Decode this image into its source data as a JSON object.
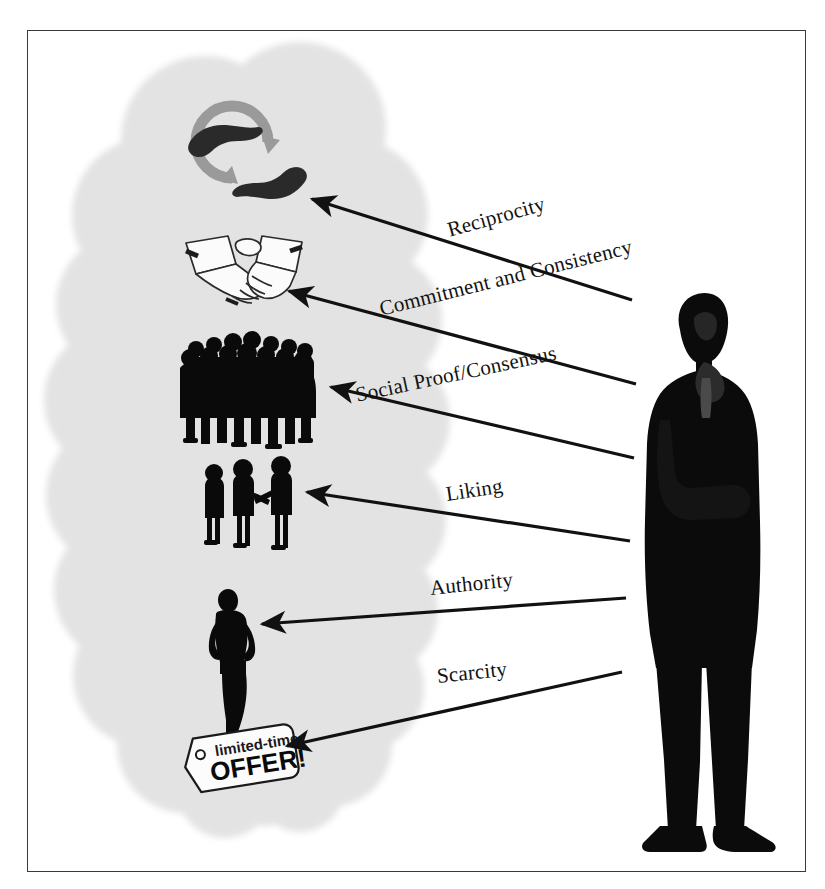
{
  "diagram": {
    "cloud": {
      "name": "thought-cloud",
      "fill": "#e3e3e3"
    },
    "figure": {
      "name": "businessman-silhouette",
      "description": "Man in dark suit, hand to chin, thinking",
      "color": "#0b0b0b"
    },
    "border_color": "#3a3a3c",
    "arrow_color": "#111111",
    "principles": [
      {
        "label": "Reciprocity",
        "icon": "hands-exchange-icon",
        "icon_description": "Two dark hands with gray circular exchange arrows",
        "label_x": 448,
        "label_y": 218,
        "label_rotation": -15.5,
        "arrow_x1": 632,
        "arrow_y1": 300,
        "arrow_x2": 308,
        "arrow_y2": 196
      },
      {
        "label": "Commitment and Consistency",
        "icon": "handshake-icon",
        "icon_description": "Line-art drawing of two hands shaking",
        "label_x": 380,
        "label_y": 297,
        "label_rotation": -14.0,
        "arrow_x1": 636,
        "arrow_y1": 384,
        "arrow_x2": 285,
        "arrow_y2": 288
      },
      {
        "label": "Social Proof/Consensus",
        "icon": "crowd-icon",
        "icon_description": "Dense black silhouette of a crowd of people",
        "label_x": 356,
        "label_y": 383,
        "label_rotation": -12.0,
        "arrow_x1": 634,
        "arrow_y1": 458,
        "arrow_x2": 327,
        "arrow_y2": 384
      },
      {
        "label": "Liking",
        "icon": "three-people-icon",
        "icon_description": "Three black standing figures, two shaking hands",
        "label_x": 446,
        "label_y": 482,
        "label_rotation": -8.5,
        "arrow_x1": 630,
        "arrow_y1": 541,
        "arrow_x2": 303,
        "arrow_y2": 490
      },
      {
        "label": "Authority",
        "icon": "standing-figure-icon",
        "icon_description": "Single confident black standing silhouette",
        "label_x": 430,
        "label_y": 576,
        "label_rotation": -6.0,
        "arrow_x1": 626,
        "arrow_y1": 598,
        "arrow_x2": 258,
        "arrow_y2": 625
      },
      {
        "label": "Scarcity",
        "icon": "limited-time-offer-tag-icon",
        "icon_description": "Price tag reading limited-time OFFER!",
        "label_x": 437,
        "label_y": 664,
        "label_rotation": -6.0,
        "arrow_x1": 622,
        "arrow_y1": 672,
        "arrow_x2": 283,
        "arrow_y2": 748
      }
    ],
    "tag": {
      "line1": "limited-time",
      "line2": "OFFER!"
    }
  }
}
